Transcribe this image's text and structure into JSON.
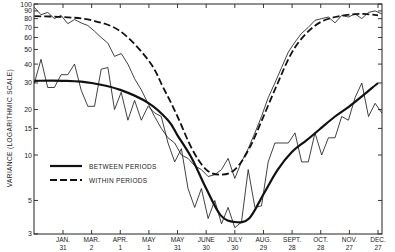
{
  "chart_data": {
    "type": "line",
    "title": "",
    "xlabel": "",
    "ylabel": "VARIANCE (LOGARITHMIC SCALE)",
    "yscale": "log",
    "ylim": [
      3,
      100
    ],
    "y_ticks": [
      3,
      5,
      10,
      15,
      20,
      30,
      40,
      50,
      60,
      70,
      80,
      90,
      100
    ],
    "y_tick_labels": [
      "3",
      "5",
      "10",
      "15",
      "20",
      "30",
      "40",
      "50",
      "60",
      "70",
      "80",
      "90",
      "100"
    ],
    "x_ticks": [
      {
        "day": 31,
        "line1": "JAN.",
        "line2": "31"
      },
      {
        "day": 61,
        "line1": "MAR.",
        "line2": "2"
      },
      {
        "day": 91,
        "line1": "APR.",
        "line2": "1"
      },
      {
        "day": 121,
        "line1": "MAY",
        "line2": "1"
      },
      {
        "day": 151,
        "line1": "MAY",
        "line2": "31"
      },
      {
        "day": 181,
        "line1": "JUNE",
        "line2": "30"
      },
      {
        "day": 211,
        "line1": "JULY",
        "line2": "30"
      },
      {
        "day": 241,
        "line1": "AUG.",
        "line2": "29"
      },
      {
        "day": 271,
        "line1": "SEPT.",
        "line2": "28"
      },
      {
        "day": 301,
        "line1": "OCT.",
        "line2": "28"
      },
      {
        "day": 331,
        "line1": "NOV.",
        "line2": "27"
      },
      {
        "day": 361,
        "line1": "DEC.",
        "line2": "27"
      }
    ],
    "grid": false,
    "legend_position": "lower-left",
    "legend": [
      {
        "label": "BETWEEN PERIODS",
        "style": "solid"
      },
      {
        "label": "WITHIN PERIODS",
        "style": "dashed"
      }
    ],
    "series": [
      {
        "name": "BETWEEN PERIODS (smoothed)",
        "style": "solid-thick",
        "x": [
          1,
          31,
          61,
          91,
          121,
          141,
          151,
          166,
          181,
          196,
          211,
          226,
          241,
          256,
          271,
          286,
          301,
          316,
          331,
          346,
          361
        ],
        "values": [
          31,
          31,
          30,
          27,
          22,
          17,
          13.5,
          9.5,
          6.0,
          4.0,
          3.6,
          3.8,
          5.5,
          8.0,
          10.5,
          12.5,
          15,
          18,
          21,
          25,
          30
        ]
      },
      {
        "name": "WITHIN PERIODS (smoothed)",
        "style": "dashed-thick",
        "x": [
          1,
          31,
          61,
          91,
          121,
          136,
          151,
          166,
          181,
          196,
          211,
          226,
          241,
          256,
          271,
          286,
          301,
          316,
          331,
          346,
          361
        ],
        "values": [
          83,
          82,
          78,
          66,
          42,
          28,
          18,
          11,
          8.0,
          7.4,
          8.0,
          11,
          18,
          30,
          48,
          64,
          76,
          82,
          85,
          86,
          84
        ]
      },
      {
        "name": "BETWEEN PERIODS (observed)",
        "style": "solid-thin",
        "x": [
          1,
          8,
          15,
          22,
          29,
          36,
          43,
          50,
          57,
          64,
          71,
          78,
          85,
          92,
          99,
          106,
          113,
          120,
          127,
          134,
          141,
          148,
          155,
          162,
          169,
          176,
          183,
          190,
          197,
          204,
          211,
          218,
          225,
          232,
          239,
          246,
          253,
          260,
          267,
          274,
          281,
          288,
          295,
          302,
          309,
          316,
          323,
          330,
          337,
          344,
          351,
          358,
          365
        ],
        "values": [
          30,
          43,
          28,
          28,
          34,
          34,
          40,
          27,
          21,
          21,
          37,
          38,
          20,
          26,
          17,
          23,
          17,
          21,
          19,
          18,
          12,
          9,
          11,
          6,
          4.5,
          6,
          3.8,
          5,
          3.5,
          4.5,
          3.3,
          3.6,
          8,
          4.5,
          4.6,
          9,
          12,
          12,
          12,
          14,
          9,
          9,
          14,
          10,
          13,
          13,
          18,
          17,
          24,
          30,
          18,
          22,
          19
        ]
      },
      {
        "name": "WITHIN PERIODS (observed)",
        "style": "dashed-thin",
        "x": [
          1,
          8,
          15,
          22,
          29,
          36,
          43,
          50,
          57,
          64,
          71,
          78,
          85,
          92,
          99,
          106,
          113,
          120,
          127,
          134,
          141,
          148,
          155,
          162,
          169,
          176,
          183,
          190,
          197,
          204,
          211,
          218,
          225,
          232,
          239,
          246,
          253,
          260,
          267,
          274,
          281,
          288,
          295,
          302,
          309,
          316,
          323,
          330,
          337,
          344,
          351,
          358,
          365
        ],
        "values": [
          95,
          85,
          88,
          80,
          84,
          74,
          79,
          75,
          72,
          66,
          60,
          55,
          45,
          47,
          40,
          32,
          27,
          22,
          18,
          15,
          13,
          12,
          10,
          9.5,
          8.5,
          8,
          7.2,
          7.4,
          8,
          9.5,
          7,
          9,
          11,
          14,
          18,
          24,
          30,
          38,
          48,
          56,
          64,
          70,
          78,
          80,
          82,
          75,
          84,
          82,
          86,
          80,
          88,
          90,
          86
        ]
      }
    ]
  }
}
